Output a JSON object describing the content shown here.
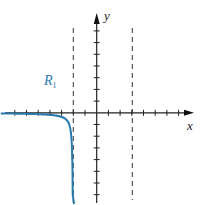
{
  "diagram": {
    "x_axis_label": "x",
    "y_axis_label": "y",
    "region_label": "R",
    "region_subscript": "1",
    "vertical_asymptotes": [
      -2,
      3
    ],
    "x_range": [
      -8,
      8
    ],
    "y_range": [
      -8,
      8
    ],
    "curve": {
      "formula": "y = -0.5/(x+2) for x < -2",
      "color": "#2a7ab0"
    },
    "colors": {
      "axes": "#222222",
      "asymptote": "#333333",
      "curve": "#2a7ab0",
      "label": "#2a7ab0"
    }
  }
}
